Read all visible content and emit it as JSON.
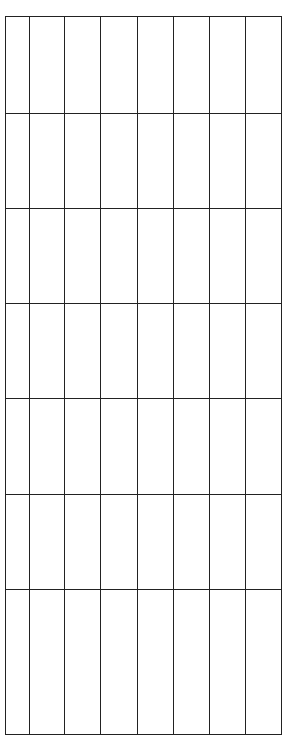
{
  "grid": {
    "rows": 7,
    "columns": 8,
    "column_widths": [
      24,
      35,
      36,
      37,
      36,
      36,
      36,
      36
    ],
    "row_heights": [
      97,
      95,
      95,
      95,
      96,
      95,
      145
    ],
    "line_color": "#222222",
    "cells": [
      [
        "",
        "",
        "",
        "",
        "",
        "",
        "",
        ""
      ],
      [
        "",
        "",
        "",
        "",
        "",
        "",
        "",
        ""
      ],
      [
        "",
        "",
        "",
        "",
        "",
        "",
        "",
        ""
      ],
      [
        "",
        "",
        "",
        "",
        "",
        "",
        "",
        ""
      ],
      [
        "",
        "",
        "",
        "",
        "",
        "",
        "",
        ""
      ],
      [
        "",
        "",
        "",
        "",
        "",
        "",
        "",
        ""
      ],
      [
        "",
        "",
        "",
        "",
        "",
        "",
        "",
        ""
      ]
    ]
  }
}
